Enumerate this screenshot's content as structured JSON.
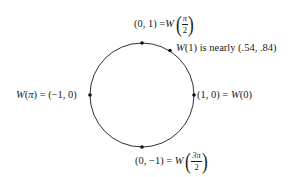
{
  "diagram": {
    "type": "unit-circle-winding-function",
    "circle": {
      "cx": 142,
      "cy": 95,
      "r": 52,
      "stroke": "#1a1a1a"
    },
    "points": [
      {
        "name": "point-top",
        "x": 142,
        "y": 43
      },
      {
        "name": "point-w1",
        "x": 170,
        "y": 50
      },
      {
        "name": "point-left",
        "x": 90,
        "y": 95
      },
      {
        "name": "point-right",
        "x": 194,
        "y": 95
      },
      {
        "name": "point-bottom",
        "x": 142,
        "y": 147
      }
    ],
    "labels": {
      "top": {
        "lhs": "(0, 1) = ",
        "func": "W",
        "frac_num": "π",
        "frac_den": "2"
      },
      "w1": {
        "func": "W",
        "arg": "(1)",
        "text": " is nearly (.54, .84)"
      },
      "left": {
        "func": "W",
        "arg_open": "(",
        "arg": "π",
        "arg_close": ")",
        "rhs": " = (−1, 0)"
      },
      "right": {
        "lhs": "(1, 0) = ",
        "func": "W",
        "arg": "(0)"
      },
      "bottom": {
        "lhs": "(0, −1) = ",
        "func": "W",
        "frac_num": "3π",
        "frac_den": "2"
      }
    }
  }
}
